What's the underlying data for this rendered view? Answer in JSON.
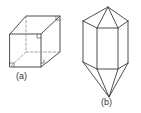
{
  "figure": {
    "panels": [
      {
        "id": "a",
        "label": "(a)",
        "description": "cube with hidden edges dashed and right-angle marks"
      },
      {
        "id": "b",
        "label": "(b)",
        "description": "hexagonal prism crystal with pyramidal terminations"
      }
    ],
    "colors": {
      "stroke": "#3a3a3a",
      "hidden_stroke": "#8a8a8a",
      "background": "#ffffff"
    }
  }
}
